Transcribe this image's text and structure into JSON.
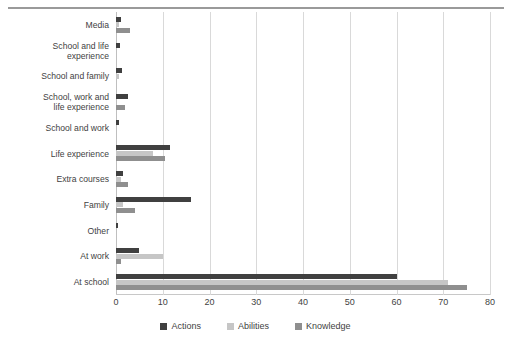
{
  "chart_data": {
    "type": "bar",
    "orientation": "horizontal",
    "title": "",
    "xlabel": "",
    "ylabel": "",
    "xlim": [
      0,
      80
    ],
    "xticks": [
      0,
      10,
      20,
      30,
      40,
      50,
      60,
      70,
      80
    ],
    "grid": true,
    "legend_position": "bottom",
    "categories": [
      "Media",
      "School and life\nexperience",
      "School and family",
      "School, work and\nlife experience",
      "School and work",
      "Life experience",
      "Extra courses",
      "Family",
      "Other",
      "At work",
      "At school"
    ],
    "series": [
      {
        "name": "Actions",
        "color": "#404040",
        "values": [
          1,
          0.8,
          1.2,
          2.5,
          0.7,
          11.5,
          1.5,
          16,
          0.5,
          5,
          60
        ]
      },
      {
        "name": "Abilities",
        "color": "#c6c6c6",
        "values": [
          0.6,
          0,
          0.6,
          0,
          0,
          8,
          1,
          1.5,
          0,
          10,
          71
        ]
      },
      {
        "name": "Knowledge",
        "color": "#8f8f8f",
        "values": [
          3,
          0,
          0,
          2,
          0,
          10.5,
          2.5,
          4,
          0,
          1,
          75
        ]
      }
    ]
  },
  "legend": {
    "items": [
      {
        "label": "Actions",
        "swatch": "actions"
      },
      {
        "label": "Abilities",
        "swatch": "abilities"
      },
      {
        "label": "Knowledge",
        "swatch": "knowledge"
      }
    ]
  }
}
